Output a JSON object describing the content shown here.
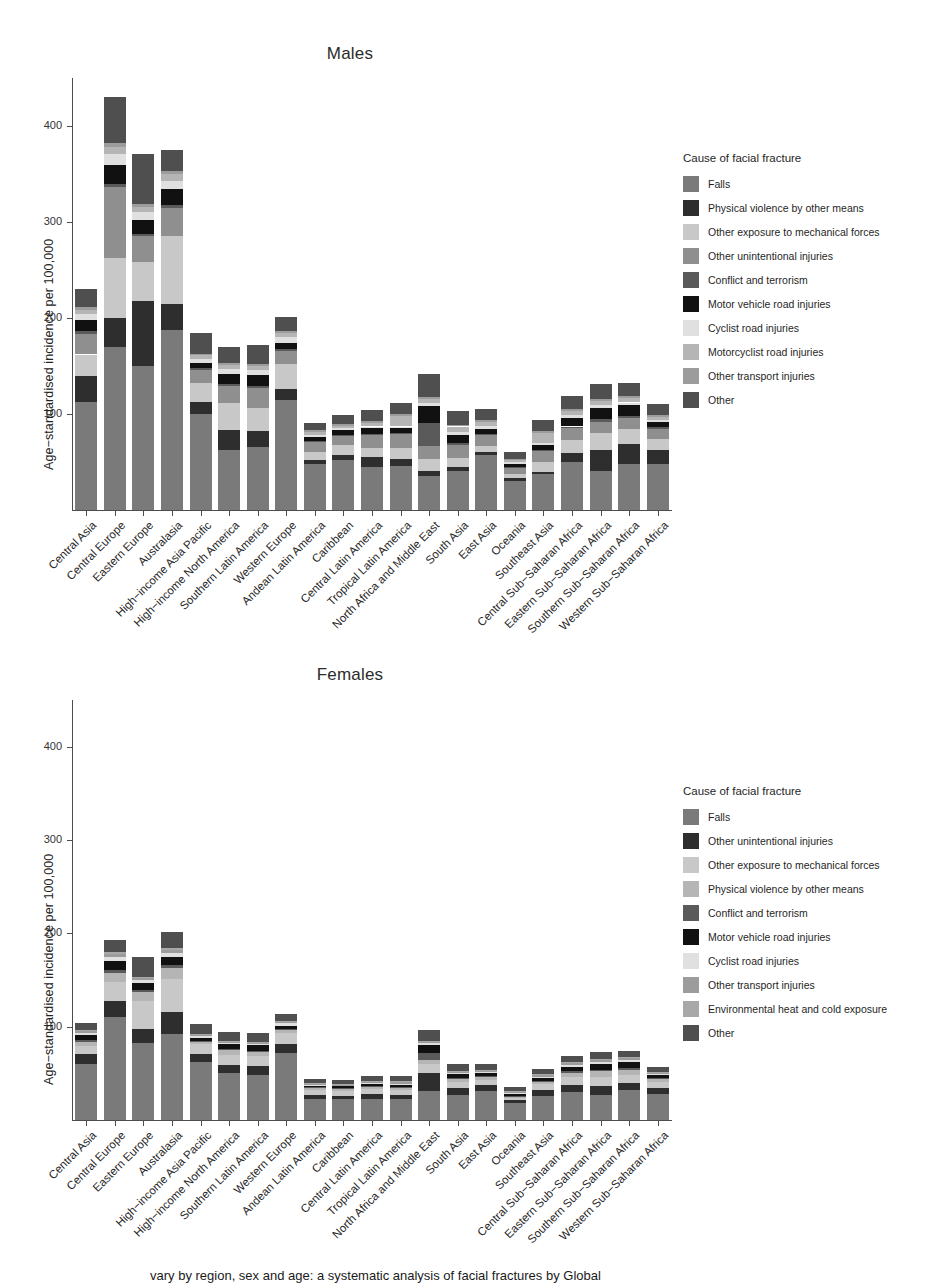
{
  "caption": "vary by region, sex and age: a systematic analysis of facial fractures by Global",
  "palette": {
    "falls": "#7a7a7a",
    "physical_violence": "#2e2e2e",
    "other_exposure_mech": "#c8c8c8",
    "other_unintentional": "#8f8f8f",
    "conflict_terrorism": "#5a5a5a",
    "motor_vehicle": "#111111",
    "cyclist": "#e0e0e0",
    "motorcyclist": "#b5b5b5",
    "other_transport": "#9c9c9c",
    "environmental_heat_cold": "#a8a8a8",
    "other": "#4f4f4f",
    "axis": "#4d4d4d"
  },
  "males": {
    "title": "Males",
    "ylabel": "Age−standardised incidence per 100,000",
    "legend_title": "Cause of facial fracture",
    "legend": [
      {
        "label": "Falls",
        "key": "falls"
      },
      {
        "label": "Physical violence by other means",
        "key": "physical_violence"
      },
      {
        "label": "Other exposure to mechanical forces",
        "key": "other_exposure_mech"
      },
      {
        "label": "Other unintentional injuries",
        "key": "other_unintentional"
      },
      {
        "label": "Conflict and terrorism",
        "key": "conflict_terrorism"
      },
      {
        "label": "Motor vehicle road injuries",
        "key": "motor_vehicle"
      },
      {
        "label": "Cyclist road injuries",
        "key": "cyclist"
      },
      {
        "label": "Motorcyclist road injuries",
        "key": "motorcyclist"
      },
      {
        "label": "Other transport injuries",
        "key": "other_transport"
      },
      {
        "label": "Other",
        "key": "other"
      }
    ]
  },
  "females": {
    "title": "Females",
    "ylabel": "Age−standardised incidence per 100,000",
    "legend_title": "Cause of facial fracture",
    "legend": [
      {
        "label": "Falls",
        "key": "falls"
      },
      {
        "label": "Other unintentional injuries",
        "key": "physical_violence"
      },
      {
        "label": "Other exposure to mechanical forces",
        "key": "other_exposure_mech"
      },
      {
        "label": "Physical violence by other means",
        "key": "motorcyclist"
      },
      {
        "label": "Conflict and terrorism",
        "key": "conflict_terrorism"
      },
      {
        "label": "Motor vehicle road injuries",
        "key": "motor_vehicle"
      },
      {
        "label": "Cyclist road injuries",
        "key": "cyclist"
      },
      {
        "label": "Other transport injuries",
        "key": "other_transport"
      },
      {
        "label": "Environmental heat and cold exposure",
        "key": "environmental_heat_cold"
      },
      {
        "label": "Other",
        "key": "other"
      }
    ]
  },
  "chart_data": [
    {
      "type": "bar",
      "stacked": true,
      "panel": "Males",
      "title": "Males",
      "xlabel": "",
      "ylabel": "Age−standardised incidence per 100,000",
      "ylim": [
        0,
        450
      ],
      "yticks": [
        100,
        200,
        300,
        400
      ],
      "grid": false,
      "legend_position": "right",
      "legend_title": "Cause of facial fracture",
      "categories": [
        "Central Asia",
        "Central Europe",
        "Eastern Europe",
        "Australasia",
        "High-income Asia Pacific",
        "High-income North America",
        "Southern Latin America",
        "Western Europe",
        "Andean Latin America",
        "Caribbean",
        "Central Latin America",
        "Tropical Latin America",
        "North Africa and Middle East",
        "South Asia",
        "East Asia",
        "Oceania",
        "Southeast Asia",
        "Central Sub-Saharan Africa",
        "Eastern Sub-Saharan Africa",
        "Southern Sub-Saharan Africa",
        "Western Sub-Saharan Africa"
      ],
      "series": [
        {
          "name": "Falls",
          "key": "falls",
          "values": [
            113,
            170,
            150,
            188,
            100,
            62,
            66,
            115,
            48,
            52,
            45,
            46,
            35,
            41,
            57,
            30,
            38,
            50,
            41,
            48,
            48
          ]
        },
        {
          "name": "Physical violence by other means",
          "key": "physical_violence",
          "values": [
            27,
            30,
            68,
            27,
            12,
            21,
            16,
            11,
            4,
            5,
            10,
            7,
            6,
            4,
            3,
            3,
            2,
            9,
            22,
            21,
            14
          ]
        },
        {
          "name": "Other exposure to mechanical forces",
          "key": "other_exposure_mech",
          "values": [
            22,
            62,
            40,
            70,
            20,
            28,
            24,
            26,
            8,
            11,
            10,
            12,
            12,
            9,
            7,
            5,
            10,
            14,
            17,
            15,
            12
          ]
        },
        {
          "name": "Other unintentional injuries",
          "key": "other_unintentional",
          "values": [
            21,
            74,
            27,
            30,
            14,
            18,
            21,
            14,
            11,
            9,
            13,
            14,
            14,
            14,
            11,
            6,
            12,
            12,
            12,
            12,
            10
          ]
        },
        {
          "name": "Conflict and terrorism",
          "key": "conflict_terrorism",
          "values": [
            3,
            4,
            3,
            3,
            2,
            2,
            2,
            2,
            1,
            1,
            1,
            1,
            24,
            2,
            1,
            1,
            1,
            2,
            3,
            2,
            2
          ]
        },
        {
          "name": "Motor vehicle road injuries",
          "key": "motor_vehicle",
          "values": [
            12,
            19,
            14,
            16,
            5,
            11,
            12,
            6,
            4,
            5,
            6,
            5,
            17,
            8,
            5,
            3,
            5,
            9,
            11,
            11,
            6
          ]
        },
        {
          "name": "Cyclist road injuries",
          "key": "cyclist",
          "values": [
            6,
            12,
            8,
            9,
            4,
            5,
            5,
            6,
            2,
            2,
            2,
            2,
            3,
            3,
            4,
            2,
            2,
            3,
            3,
            3,
            2
          ]
        },
        {
          "name": "Motorcyclist road injuries",
          "key": "motorcyclist",
          "values": [
            4,
            7,
            6,
            7,
            4,
            4,
            4,
            4,
            3,
            3,
            4,
            11,
            5,
            6,
            4,
            2,
            10,
            4,
            5,
            5,
            3
          ]
        },
        {
          "name": "Other transport injuries",
          "key": "other_transport",
          "values": [
            3,
            4,
            3,
            3,
            2,
            2,
            2,
            2,
            2,
            2,
            2,
            2,
            2,
            2,
            2,
            1,
            2,
            2,
            2,
            2,
            2
          ]
        },
        {
          "name": "Other",
          "key": "other",
          "values": [
            19,
            48,
            52,
            22,
            21,
            17,
            20,
            15,
            8,
            9,
            11,
            11,
            24,
            14,
            11,
            7,
            12,
            14,
            15,
            13,
            11
          ]
        }
      ]
    },
    {
      "type": "bar",
      "stacked": true,
      "panel": "Females",
      "title": "Females",
      "xlabel": "",
      "ylabel": "Age−standardised incidence per 100,000",
      "ylim": [
        0,
        450
      ],
      "yticks": [
        100,
        200,
        300,
        400
      ],
      "grid": false,
      "legend_position": "right",
      "legend_title": "Cause of facial fracture",
      "categories": [
        "Central Asia",
        "Central Europe",
        "Eastern Europe",
        "Australasia",
        "High-income Asia Pacific",
        "High-income North America",
        "Southern Latin America",
        "Western Europe",
        "Andean Latin America",
        "Caribbean",
        "Central Latin America",
        "Tropical Latin America",
        "North Africa and Middle East",
        "South Asia",
        "East Asia",
        "Oceania",
        "Southeast Asia",
        "Central Sub-Saharan Africa",
        "Eastern Sub-Saharan Africa",
        "Southern Sub-Saharan Africa",
        "Western Sub-Saharan Africa"
      ],
      "series": [
        {
          "name": "Falls",
          "key": "falls",
          "values": [
            60,
            110,
            82,
            92,
            62,
            50,
            48,
            72,
            22,
            22,
            23,
            23,
            31,
            27,
            31,
            18,
            26,
            30,
            27,
            32,
            28
          ]
        },
        {
          "name": "Other unintentional injuries",
          "key": "physical_violence",
          "values": [
            11,
            18,
            16,
            24,
            9,
            9,
            10,
            9,
            5,
            4,
            5,
            4,
            19,
            7,
            6,
            3,
            6,
            8,
            9,
            8,
            6
          ]
        },
        {
          "name": "Other exposure to mechanical forces",
          "key": "other_exposure_mech",
          "values": [
            8,
            20,
            30,
            35,
            10,
            11,
            11,
            12,
            5,
            5,
            5,
            5,
            10,
            7,
            6,
            3,
            7,
            8,
            10,
            8,
            7
          ]
        },
        {
          "name": "Physical violence by other means",
          "key": "motorcyclist",
          "values": [
            5,
            10,
            9,
            12,
            3,
            5,
            4,
            4,
            2,
            2,
            2,
            2,
            4,
            3,
            3,
            1,
            2,
            4,
            6,
            6,
            3
          ]
        },
        {
          "name": "Conflict and terrorism",
          "key": "conflict_terrorism",
          "values": [
            2,
            3,
            2,
            3,
            1,
            1,
            1,
            1,
            1,
            1,
            1,
            1,
            8,
            1,
            1,
            1,
            1,
            2,
            2,
            2,
            1
          ]
        },
        {
          "name": "Motor vehicle road injuries",
          "key": "motor_vehicle",
          "values": [
            5,
            9,
            8,
            9,
            3,
            5,
            6,
            3,
            2,
            2,
            3,
            3,
            8,
            4,
            3,
            2,
            3,
            5,
            6,
            6,
            3
          ]
        },
        {
          "name": "Cyclist road injuries",
          "key": "cyclist",
          "values": [
            2,
            5,
            3,
            4,
            2,
            2,
            2,
            3,
            1,
            1,
            1,
            1,
            2,
            1,
            2,
            1,
            1,
            2,
            2,
            2,
            1
          ]
        },
        {
          "name": "Other transport injuries",
          "key": "other_transport",
          "values": [
            2,
            3,
            2,
            3,
            1,
            1,
            1,
            1,
            1,
            1,
            1,
            2,
            2,
            2,
            1,
            1,
            2,
            2,
            2,
            2,
            1
          ]
        },
        {
          "name": "Environmental heat and cold exposure",
          "key": "environmental_heat_cold",
          "values": [
            1,
            2,
            1,
            2,
            1,
            1,
            1,
            1,
            1,
            1,
            1,
            1,
            1,
            1,
            1,
            1,
            1,
            1,
            1,
            1,
            1
          ]
        },
        {
          "name": "Other",
          "key": "other",
          "values": [
            8,
            13,
            22,
            17,
            11,
            9,
            9,
            8,
            4,
            4,
            5,
            5,
            11,
            7,
            6,
            4,
            6,
            7,
            8,
            7,
            6
          ]
        }
      ]
    }
  ]
}
